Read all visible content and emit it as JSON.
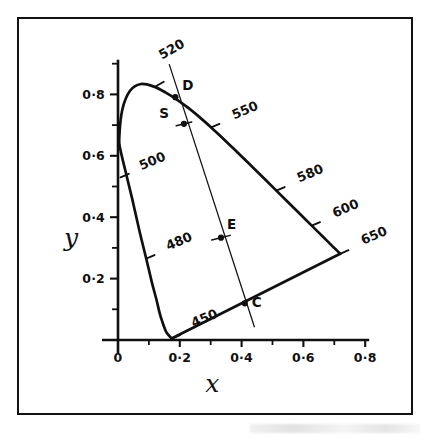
{
  "figure": {
    "kind": "cie-chromaticity-diagram",
    "border_color": "#121212",
    "background": "#ffffff",
    "ink_color": "#101010"
  },
  "chart_data": {
    "type": "line",
    "title": "",
    "subtitle": "",
    "xlabel": "x",
    "ylabel": "y",
    "xlim": [
      0,
      0.8
    ],
    "ylim": [
      0,
      0.9
    ],
    "grid": false,
    "legend": "none",
    "xticks": [
      0,
      0.2,
      0.4,
      0.6,
      0.8
    ],
    "xtick_labels": [
      "0",
      "0·2",
      "0·4",
      "0·6",
      "0·8"
    ],
    "xminor_ticks": [
      0.1,
      0.3,
      0.5,
      0.7
    ],
    "yticks": [
      0.2,
      0.4,
      0.6,
      0.8
    ],
    "ytick_labels": [
      "0·2",
      "0·4",
      "0·6",
      "0·8"
    ],
    "yminor_ticks": [
      0.1,
      0.3,
      0.5,
      0.7,
      0.9
    ],
    "series": [
      {
        "name": "spectral-locus",
        "kind": "curve",
        "closed": false,
        "points": [
          [
            0.1735,
            0.0048
          ],
          [
            0.1625,
            0.0175
          ],
          [
            0.1545,
            0.0295
          ],
          [
            0.144,
            0.058
          ],
          [
            0.1355,
            0.085
          ],
          [
            0.1241,
            0.1326
          ],
          [
            0.1096,
            0.1878
          ],
          [
            0.0913,
            0.2653
          ],
          [
            0.0687,
            0.3583
          ],
          [
            0.0454,
            0.462
          ],
          [
            0.0235,
            0.5528
          ],
          [
            0.0082,
            0.618
          ],
          [
            0.0039,
            0.6548
          ],
          [
            0.0139,
            0.7502
          ],
          [
            0.0389,
            0.812
          ],
          [
            0.0743,
            0.8338
          ],
          [
            0.1142,
            0.8262
          ],
          [
            0.1547,
            0.8059
          ],
          [
            0.1929,
            0.7816
          ],
          [
            0.2296,
            0.7543
          ],
          [
            0.2658,
            0.7243
          ],
          [
            0.3016,
            0.6923
          ],
          [
            0.3373,
            0.6589
          ],
          [
            0.3731,
            0.6245
          ],
          [
            0.4087,
            0.5896
          ],
          [
            0.4441,
            0.5547
          ],
          [
            0.4788,
            0.5202
          ],
          [
            0.5125,
            0.4866
          ],
          [
            0.5448,
            0.4544
          ],
          [
            0.5752,
            0.4242
          ],
          [
            0.6029,
            0.3965
          ],
          [
            0.627,
            0.3725
          ],
          [
            0.6482,
            0.3514
          ],
          [
            0.6658,
            0.334
          ],
          [
            0.6801,
            0.3197
          ],
          [
            0.6915,
            0.3083
          ],
          [
            0.7006,
            0.2993
          ],
          [
            0.7079,
            0.292
          ],
          [
            0.719,
            0.2809
          ]
        ]
      },
      {
        "name": "purple-line",
        "kind": "straight",
        "points": [
          [
            0.719,
            0.2809
          ],
          [
            0.1735,
            0.0048
          ]
        ]
      },
      {
        "name": "mixing-line",
        "kind": "thin-straight",
        "points": [
          [
            0.1656,
            0.8985
          ],
          [
            0.4418,
            0.0415
          ]
        ]
      }
    ],
    "wavelength_labels": [
      {
        "text": "450",
        "anchor": [
          0.1735,
          0.0048
        ],
        "label_dx": 22,
        "label_dy": -11,
        "tick_len": 9,
        "rotation": -23
      },
      {
        "text": "480",
        "anchor": [
          0.0913,
          0.2653
        ],
        "label_dx": 22,
        "label_dy": -8,
        "tick_len": 9,
        "rotation": -23
      },
      {
        "text": "500",
        "anchor": [
          0.0082,
          0.53
        ],
        "label_dx": 21,
        "label_dy": -7,
        "tick_len": 9,
        "rotation": -23
      },
      {
        "text": "520",
        "anchor": [
          0.12,
          0.825
        ],
        "label_dx": 7,
        "label_dy": -27,
        "tick_len": 10,
        "rotation": -30
      },
      {
        "text": "550",
        "anchor": [
          0.3016,
          0.6923
        ],
        "label_dx": 23,
        "label_dy": -8,
        "tick_len": 9,
        "rotation": -23
      },
      {
        "text": "580",
        "anchor": [
          0.5125,
          0.4866
        ],
        "label_dx": 23,
        "label_dy": -8,
        "tick_len": 9,
        "rotation": -23
      },
      {
        "text": "600",
        "anchor": [
          0.627,
          0.3725
        ],
        "label_dx": 23,
        "label_dy": -8,
        "tick_len": 9,
        "rotation": -23
      },
      {
        "text": "650",
        "anchor": [
          0.719,
          0.2809
        ],
        "label_dx": 23,
        "label_dy": -9,
        "tick_len": 9,
        "rotation": -23
      }
    ],
    "annotated_points": [
      {
        "label": "D",
        "x": 0.1856,
        "y": 0.7908,
        "label_dx": 7,
        "label_dy": -7,
        "tick": false
      },
      {
        "label": "S",
        "x": 0.2135,
        "y": 0.704,
        "label_dx": -15,
        "label_dy": -6,
        "tick": true,
        "tick_len": 16,
        "tick_rotation": -14
      },
      {
        "label": "E",
        "x": 0.3333,
        "y": 0.3333,
        "label_dx": 6,
        "label_dy": -9,
        "tick": true,
        "tick_len": 19,
        "tick_rotation": -14
      },
      {
        "label": "C",
        "x": 0.4102,
        "y": 0.1194,
        "label_dx": 7,
        "label_dy": 4,
        "tick": false
      }
    ]
  }
}
